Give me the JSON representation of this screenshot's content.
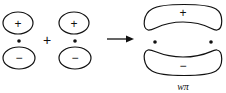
{
  "diagram": {
    "left_orbitals": [
      {
        "top_sign": "+",
        "bottom_sign": "−"
      },
      {
        "top_sign": "+",
        "bottom_sign": "−"
      }
    ],
    "operator": "+",
    "arrow": "→",
    "result": {
      "top_sign": "+",
      "bottom_sign": "−",
      "label_w": "w",
      "label_pi": "π"
    },
    "colors": {
      "stroke": "#111111",
      "background": "#ffffff"
    }
  }
}
